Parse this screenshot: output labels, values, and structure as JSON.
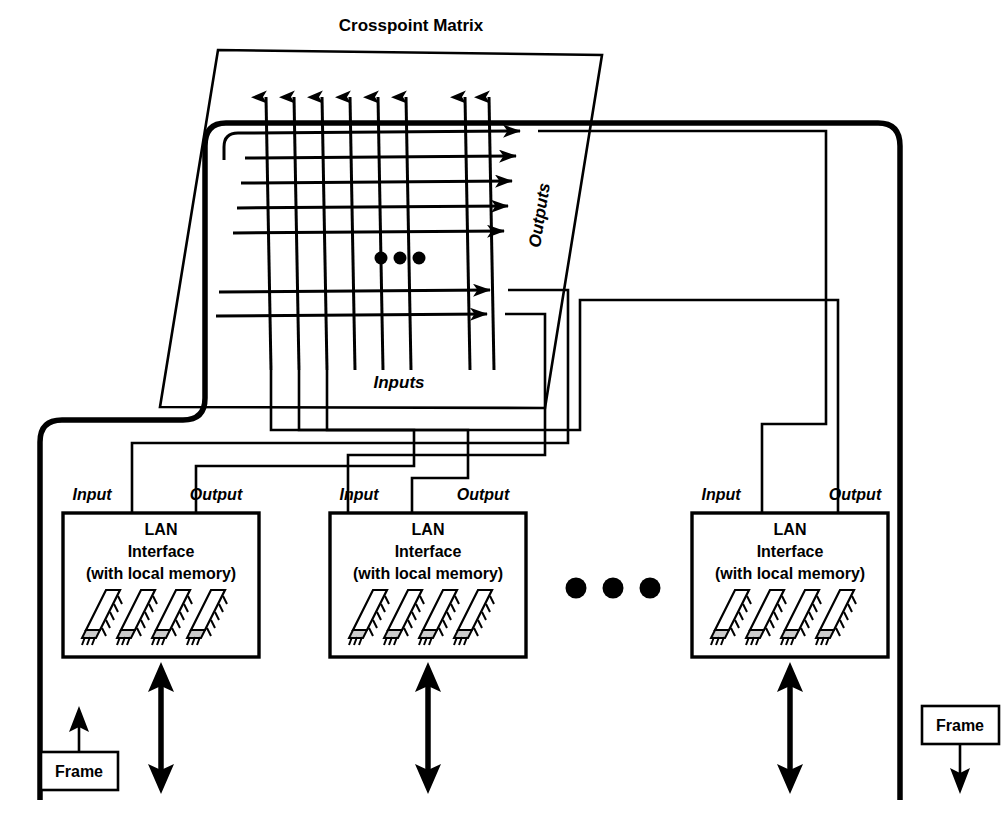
{
  "diagram": {
    "title": "Crosspoint Matrix",
    "matrix": {
      "inputs_label": "Inputs",
      "outputs_label": "Outputs",
      "ellipsis": "•••",
      "vertical_input_lines": 8,
      "horizontal_output_lines": 7,
      "upper_output_group": 5,
      "lower_output_group": 2,
      "upper_input_group": 6,
      "lower_input_group": 2
    },
    "nodes": [
      {
        "id": "node-1",
        "input_label": "Input",
        "output_label": "Output",
        "title_line1": "LAN",
        "title_line2": "Interface",
        "title_line3": "(with local memory)",
        "chip_count": 4
      },
      {
        "id": "node-2",
        "input_label": "Input",
        "output_label": "Output",
        "title_line1": "LAN",
        "title_line2": "Interface",
        "title_line3": "(with local memory)",
        "chip_count": 4
      },
      {
        "id": "node-3",
        "input_label": "Input",
        "output_label": "Output",
        "title_line1": "LAN",
        "title_line2": "Interface",
        "title_line3": "(with local memory)",
        "chip_count": 4
      }
    ],
    "node_ellipsis": "•••",
    "frames": [
      {
        "id": "frame-left",
        "label": "Frame",
        "arrow_direction": "up"
      },
      {
        "id": "frame-right",
        "label": "Frame",
        "arrow_direction": "down"
      }
    ],
    "colors": {
      "stroke": "#000000",
      "background": "#ffffff",
      "chip_pin": "#cccccc"
    }
  }
}
